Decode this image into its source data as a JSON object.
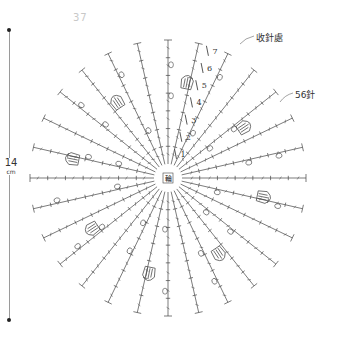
{
  "page": {
    "number": "37"
  },
  "dimension": {
    "value": "14",
    "unit": "cm"
  },
  "labels": {
    "finish_point": "收針處",
    "stitch_count": "56針",
    "center": "輪"
  },
  "diagram": {
    "type": "crochet-round-motif",
    "center": [
      168,
      178
    ],
    "radius": 138,
    "spokes": 28,
    "rounds": 7,
    "round_numbers": [
      "1",
      "2",
      "3",
      "4",
      "5",
      "6",
      "7"
    ],
    "line_color": "#444444"
  }
}
